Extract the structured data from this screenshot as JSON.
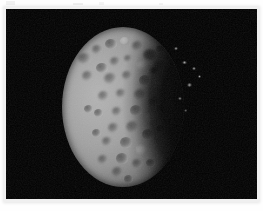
{
  "page": {
    "background_color": "#ffffff",
    "margin_color": "#fefefe",
    "artifacts_present": true
  },
  "photo": {
    "name": "astronomical-moon-photograph",
    "alt_text": "Black-and-white spacecraft photograph of a heavily cratered icy moon in gibbous phase against a black sky",
    "background_color": "#000000",
    "frame": {
      "x": 6,
      "y": 9,
      "width": 251,
      "height": 190
    }
  },
  "chart_data": {
    "type": "scatter",
    "title": "Cratered moon disk, gibbous phase",
    "xlabel": "",
    "ylabel": ""
  },
  "subject": {
    "body_name": "moon-disk",
    "phase": "gibbous",
    "illumination_direction": "left",
    "terminator_side": "right",
    "disk": {
      "left": 56,
      "top": 18,
      "width": 122,
      "height": 160
    },
    "surface_tone_hex": "#a8a8a8",
    "sky_tone_hex": "#000000",
    "limb_shadow_hex": "#0a0a0a"
  },
  "craters": [
    {
      "x": 72,
      "y": 44,
      "w": 13,
      "h": 11,
      "type": "c",
      "label": "crater-nw-1"
    },
    {
      "x": 86,
      "y": 36,
      "w": 10,
      "h": 9,
      "type": "c",
      "label": "crater-nw-2"
    },
    {
      "x": 99,
      "y": 30,
      "w": 12,
      "h": 10,
      "type": "c",
      "label": "crater-n-1"
    },
    {
      "x": 114,
      "y": 28,
      "w": 9,
      "h": 8,
      "type": "bright",
      "label": "crater-n-2"
    },
    {
      "x": 126,
      "y": 32,
      "w": 11,
      "h": 10,
      "type": "c",
      "label": "crater-ne-1"
    },
    {
      "x": 137,
      "y": 40,
      "w": 14,
      "h": 12,
      "type": "dark",
      "label": "crater-ne-large"
    },
    {
      "x": 150,
      "y": 36,
      "w": 9,
      "h": 8,
      "type": "c",
      "label": "crater-ne-2"
    },
    {
      "x": 148,
      "y": 52,
      "w": 11,
      "h": 10,
      "type": "c",
      "label": "crater-e-1"
    },
    {
      "x": 131,
      "y": 52,
      "w": 10,
      "h": 9,
      "type": "bright",
      "label": "crater-ne-3"
    },
    {
      "x": 118,
      "y": 46,
      "w": 8,
      "h": 7,
      "type": "c",
      "label": "crater-n-3"
    },
    {
      "x": 104,
      "y": 48,
      "w": 10,
      "h": 9,
      "type": "c",
      "label": "crater-nc-1"
    },
    {
      "x": 90,
      "y": 54,
      "w": 12,
      "h": 10,
      "type": "c",
      "label": "crater-nw-3"
    },
    {
      "x": 76,
      "y": 62,
      "w": 11,
      "h": 10,
      "type": "c",
      "label": "crater-w-1"
    },
    {
      "x": 98,
      "y": 64,
      "w": 13,
      "h": 11,
      "type": "c",
      "label": "crater-c-1"
    },
    {
      "x": 116,
      "y": 62,
      "w": 10,
      "h": 9,
      "type": "c",
      "label": "crater-c-2"
    },
    {
      "x": 133,
      "y": 66,
      "w": 12,
      "h": 11,
      "type": "c",
      "label": "crater-e-2"
    },
    {
      "x": 147,
      "y": 70,
      "w": 10,
      "h": 9,
      "type": "bright",
      "label": "crater-e-3"
    },
    {
      "x": 128,
      "y": 80,
      "w": 13,
      "h": 11,
      "type": "c",
      "label": "crater-c-3"
    },
    {
      "x": 110,
      "y": 80,
      "w": 10,
      "h": 9,
      "type": "c",
      "label": "crater-c-4"
    },
    {
      "x": 92,
      "y": 82,
      "w": 11,
      "h": 10,
      "type": "c",
      "label": "crater-w-2"
    },
    {
      "x": 143,
      "y": 88,
      "w": 11,
      "h": 10,
      "type": "c",
      "label": "crater-e-4"
    },
    {
      "x": 124,
      "y": 96,
      "w": 12,
      "h": 11,
      "type": "c",
      "label": "crater-c-5"
    },
    {
      "x": 106,
      "y": 98,
      "w": 10,
      "h": 9,
      "type": "c",
      "label": "crater-c-6"
    },
    {
      "x": 88,
      "y": 100,
      "w": 9,
      "h": 8,
      "type": "c",
      "label": "crater-w-3"
    },
    {
      "x": 140,
      "y": 104,
      "w": 10,
      "h": 9,
      "type": "bright",
      "label": "crater-e-5"
    },
    {
      "x": 120,
      "y": 112,
      "w": 13,
      "h": 12,
      "type": "c",
      "label": "crater-s-1"
    },
    {
      "x": 102,
      "y": 114,
      "w": 11,
      "h": 10,
      "type": "c",
      "label": "crater-s-2"
    },
    {
      "x": 136,
      "y": 120,
      "w": 12,
      "h": 11,
      "type": "c",
      "label": "crater-se-1"
    },
    {
      "x": 114,
      "y": 128,
      "w": 12,
      "h": 11,
      "type": "c",
      "label": "crater-s-3"
    },
    {
      "x": 96,
      "y": 128,
      "w": 10,
      "h": 9,
      "type": "c",
      "label": "crater-sw-1"
    },
    {
      "x": 130,
      "y": 136,
      "w": 11,
      "h": 10,
      "type": "bright",
      "label": "crater-se-2"
    },
    {
      "x": 110,
      "y": 144,
      "w": 12,
      "h": 11,
      "type": "c",
      "label": "crater-s-4"
    },
    {
      "x": 92,
      "y": 146,
      "w": 10,
      "h": 9,
      "type": "c",
      "label": "crater-sw-2"
    },
    {
      "x": 126,
      "y": 150,
      "w": 10,
      "h": 9,
      "type": "c",
      "label": "crater-se-3"
    },
    {
      "x": 106,
      "y": 158,
      "w": 11,
      "h": 10,
      "type": "c",
      "label": "crater-s-5"
    },
    {
      "x": 86,
      "y": 120,
      "w": 9,
      "h": 8,
      "type": "c",
      "label": "crater-w-4"
    },
    {
      "x": 78,
      "y": 96,
      "w": 9,
      "h": 8,
      "type": "c",
      "label": "crater-w-5"
    },
    {
      "x": 144,
      "y": 58,
      "w": 8,
      "h": 7,
      "type": "dark",
      "label": "crater-e-6"
    },
    {
      "x": 152,
      "y": 96,
      "w": 8,
      "h": 8,
      "type": "c",
      "label": "crater-e-7"
    },
    {
      "x": 150,
      "y": 116,
      "w": 9,
      "h": 8,
      "type": "c",
      "label": "crater-se-4"
    },
    {
      "x": 140,
      "y": 150,
      "w": 9,
      "h": 8,
      "type": "c",
      "label": "crater-se-5"
    },
    {
      "x": 118,
      "y": 166,
      "w": 9,
      "h": 8,
      "type": "c",
      "label": "crater-s-6"
    }
  ],
  "limb_specks": [
    {
      "x": 176,
      "y": 52,
      "w": 5,
      "h": 3,
      "label": "limb-speck-1"
    },
    {
      "x": 186,
      "y": 58,
      "w": 4,
      "h": 3,
      "label": "limb-speck-2"
    },
    {
      "x": 181,
      "y": 74,
      "w": 5,
      "h": 4,
      "label": "limb-speck-3"
    },
    {
      "x": 192,
      "y": 66,
      "w": 3,
      "h": 3,
      "label": "limb-speck-4"
    },
    {
      "x": 172,
      "y": 88,
      "w": 4,
      "h": 3,
      "label": "limb-speck-5"
    },
    {
      "x": 168,
      "y": 38,
      "w": 4,
      "h": 3,
      "label": "limb-speck-6"
    },
    {
      "x": 178,
      "y": 100,
      "w": 3,
      "h": 3,
      "label": "limb-speck-7"
    }
  ]
}
